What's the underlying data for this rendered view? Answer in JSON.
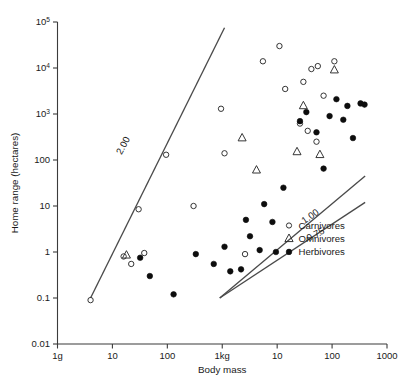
{
  "chart_data": {
    "type": "scatter",
    "title": "",
    "xlabel": "Body mass",
    "ylabel": "Home range (hectares)",
    "xscale": "log",
    "yscale": "log",
    "xlim": [
      1,
      1000000
    ],
    "ylim": [
      0.01,
      100000
    ],
    "grid": false,
    "legend_position": "inside-bottom-right",
    "xtick_labels": [
      "1g",
      "10",
      "100",
      "1kg",
      "10",
      "100",
      "1000"
    ],
    "xtick_values": [
      1,
      10,
      100,
      1000,
      10000,
      100000,
      1000000
    ],
    "ytick_labels": [
      "0.01",
      "0.1",
      "1",
      "10",
      "100",
      "10³",
      "10⁴",
      "10⁵"
    ],
    "ytick_values": [
      0.01,
      0.1,
      1,
      10,
      100,
      1000,
      10000,
      100000
    ],
    "legend": [
      {
        "name": "Carnivores",
        "marker": "open-circle"
      },
      {
        "name": "Omnivores",
        "marker": "open-triangle"
      },
      {
        "name": "Herbivores",
        "marker": "filled-circle"
      }
    ],
    "annotations": [
      {
        "text": "2.00",
        "slope": 2.0,
        "rotation": -62
      },
      {
        "text": "1.00",
        "slope": 1.0,
        "rotation": -35
      },
      {
        "text": "0.75",
        "slope": 0.75,
        "rotation": -28
      }
    ],
    "reference_lines": [
      {
        "label": "2.00",
        "slope": 2.0,
        "x0": 4.0,
        "y0": 0.1,
        "x1": 1100,
        "y1": 75000
      },
      {
        "label": "1.00",
        "slope": 1.0,
        "x0": 900,
        "y0": 0.1,
        "x1": 400000,
        "y1": 45
      },
      {
        "label": "0.75",
        "slope": 0.75,
        "x0": 900,
        "y0": 0.1,
        "x1": 400000,
        "y1": 12
      }
    ],
    "series": [
      {
        "name": "Carnivores",
        "marker": "open-circle",
        "points": [
          [
            4.0,
            0.09
          ],
          [
            16.0,
            0.8
          ],
          [
            22.0,
            0.55
          ],
          [
            38.0,
            0.95
          ],
          [
            30.0,
            8.5
          ],
          [
            95.0,
            130.0
          ],
          [
            300.0,
            10.0
          ],
          [
            1100.0,
            140.0
          ],
          [
            950.0,
            1300.0
          ],
          [
            2600.0,
            0.9
          ],
          [
            5500.0,
            14000.0
          ],
          [
            11000.0,
            30000.0
          ],
          [
            14000.0,
            3500.0
          ],
          [
            30000.0,
            5000.0
          ],
          [
            42000.0,
            9500.0
          ],
          [
            70000.0,
            2500.0
          ],
          [
            26000.0,
            620.0
          ],
          [
            36000.0,
            430.0
          ],
          [
            55000.0,
            11000.0
          ],
          [
            52000.0,
            250.0
          ],
          [
            110000.0,
            14000.0
          ]
        ]
      },
      {
        "name": "Omnivores",
        "marker": "open-triangle",
        "points": [
          [
            18.0,
            0.85
          ],
          [
            2300.0,
            300.0
          ],
          [
            4200.0,
            60.0
          ],
          [
            23000.0,
            150.0
          ],
          [
            30000.0,
            1500.0
          ],
          [
            60000.0,
            130.0
          ],
          [
            110000.0,
            9000.0
          ]
        ]
      },
      {
        "name": "Herbivores",
        "marker": "filled-circle",
        "points": [
          [
            32.0,
            0.75
          ],
          [
            48.0,
            0.3
          ],
          [
            130.0,
            0.12
          ],
          [
            330.0,
            0.9
          ],
          [
            700.0,
            0.55
          ],
          [
            1100.0,
            1.3
          ],
          [
            1400.0,
            0.38
          ],
          [
            2200.0,
            0.42
          ],
          [
            2700.0,
            5.0
          ],
          [
            3200.0,
            2.2
          ],
          [
            4800.0,
            1.1
          ],
          [
            5800.0,
            11.0
          ],
          [
            8200.0,
            4.5
          ],
          [
            9500.0,
            1.0
          ],
          [
            13000.0,
            25.0
          ],
          [
            26000.0,
            700.0
          ],
          [
            34000.0,
            1100.0
          ],
          [
            52000.0,
            400.0
          ],
          [
            70000.0,
            65.0
          ],
          [
            90000.0,
            900.0
          ],
          [
            120000.0,
            2100.0
          ],
          [
            160000.0,
            750.0
          ],
          [
            190000.0,
            1500.0
          ],
          [
            240000.0,
            300.0
          ],
          [
            330000.0,
            1700.0
          ],
          [
            390000.0,
            1600.0
          ]
        ]
      }
    ]
  },
  "legend_box": {
    "items": [
      "Carnivores",
      "Omnivores",
      "Herbivores"
    ]
  },
  "colors": {
    "axis": "#3b3b3b",
    "line": "#4a4a4a",
    "marker_stroke": "#2b2b2b",
    "marker_fill": "#0d0d0d",
    "background": "#ffffff"
  }
}
